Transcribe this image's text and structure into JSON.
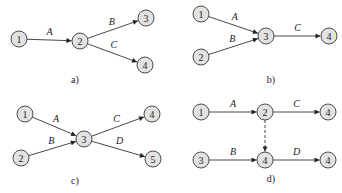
{
  "figure": {
    "panels": [
      {
        "id": "a",
        "caption": "a)",
        "nodes": [
          {
            "label": "1",
            "x": 19,
            "y": 39
          },
          {
            "label": "2",
            "x": 80,
            "y": 41
          },
          {
            "label": "3",
            "x": 146,
            "y": 18
          },
          {
            "label": "4",
            "x": 145,
            "y": 65
          }
        ],
        "edges": [
          {
            "from": 0,
            "to": 1,
            "label": "A",
            "dashed": false
          },
          {
            "from": 1,
            "to": 2,
            "label": "B",
            "dashed": false
          },
          {
            "from": 1,
            "to": 3,
            "label": "C",
            "dashed": false
          }
        ]
      },
      {
        "id": "b",
        "caption": "b)",
        "nodes": [
          {
            "label": "1",
            "x": 201,
            "y": 14
          },
          {
            "label": "2",
            "x": 201,
            "y": 57
          },
          {
            "label": "3",
            "x": 266,
            "y": 36
          },
          {
            "label": "4",
            "x": 329,
            "y": 36
          }
        ],
        "edges": [
          {
            "from": 0,
            "to": 2,
            "label": "A",
            "dashed": false
          },
          {
            "from": 1,
            "to": 2,
            "label": "B",
            "dashed": false
          },
          {
            "from": 2,
            "to": 3,
            "label": "C",
            "dashed": false
          }
        ]
      },
      {
        "id": "c",
        "caption": "c)",
        "nodes": [
          {
            "label": "1",
            "x": 25,
            "y": 114
          },
          {
            "label": "2",
            "x": 21,
            "y": 158
          },
          {
            "label": "3",
            "x": 84,
            "y": 139
          },
          {
            "label": "4",
            "x": 152,
            "y": 114
          },
          {
            "label": "5",
            "x": 153,
            "y": 159
          }
        ],
        "edges": [
          {
            "from": 0,
            "to": 2,
            "label": "A",
            "dashed": false
          },
          {
            "from": 1,
            "to": 2,
            "label": "B",
            "dashed": false
          },
          {
            "from": 2,
            "to": 3,
            "label": "C",
            "dashed": false
          },
          {
            "from": 2,
            "to": 4,
            "label": "D",
            "dashed": false
          }
        ]
      },
      {
        "id": "d",
        "caption": "d)",
        "nodes": [
          {
            "label": "1",
            "x": 201,
            "y": 112
          },
          {
            "label": "2",
            "x": 265,
            "y": 112
          },
          {
            "label": "4",
            "x": 328,
            "y": 112
          },
          {
            "label": "3",
            "x": 201,
            "y": 160
          },
          {
            "label": "4",
            "x": 265,
            "y": 160
          },
          {
            "label": "4",
            "x": 328,
            "y": 160
          }
        ],
        "edges": [
          {
            "from": 0,
            "to": 1,
            "label": "A",
            "dashed": false
          },
          {
            "from": 1,
            "to": 2,
            "label": "C",
            "dashed": false
          },
          {
            "from": 3,
            "to": 4,
            "label": "B",
            "dashed": false
          },
          {
            "from": 4,
            "to": 5,
            "label": "D",
            "dashed": false
          },
          {
            "from": 1,
            "to": 4,
            "label": "",
            "dashed": true
          }
        ]
      }
    ],
    "captions": {
      "a": {
        "text": "a)",
        "x": 75,
        "y": 83
      },
      "b": {
        "text": "b)",
        "x": 271,
        "y": 83
      },
      "c": {
        "text": "c)",
        "x": 75,
        "y": 184
      },
      "d": {
        "text": "d)",
        "x": 271,
        "y": 182
      }
    },
    "colors": {
      "node_fill": "#e2e2e2",
      "stroke": "#333333"
    }
  }
}
